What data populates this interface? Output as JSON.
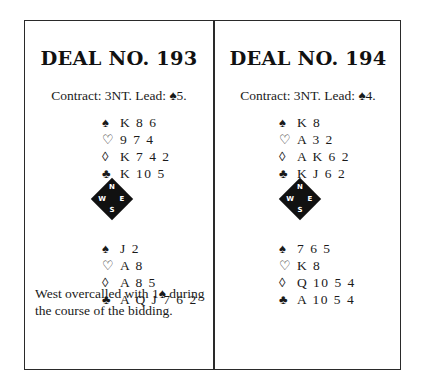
{
  "deals": [
    {
      "title": "DEAL NO. 193",
      "contract": "Contract: 3NT. Lead: ♠5.",
      "north": {
        "spades": {
          "symbol": "♠",
          "cards": "K 8 6"
        },
        "hearts": {
          "symbol": "♡",
          "cards": "9 7 4"
        },
        "diamonds": {
          "symbol": "◊",
          "cards": "K 7 4 2"
        },
        "clubs": {
          "symbol": "♣",
          "cards": "K 10 5"
        }
      },
      "south": {
        "spades": {
          "symbol": "♠",
          "cards": "J 2"
        },
        "hearts": {
          "symbol": "♡",
          "cards": "A 8"
        },
        "diamonds": {
          "symbol": "◊",
          "cards": "A 8 5"
        },
        "clubs": {
          "symbol": "♣",
          "cards": "A Q J 7 6 2"
        }
      },
      "compass": {
        "n": "N",
        "e": "E",
        "s": "S",
        "w": "W"
      },
      "note": "West overcalled with 1♠ during the course of the bidding."
    },
    {
      "title": "DEAL NO. 194",
      "contract": "Contract: 3NT. Lead: ♠4.",
      "north": {
        "spades": {
          "symbol": "♠",
          "cards": "K 8"
        },
        "hearts": {
          "symbol": "♡",
          "cards": "A 3 2"
        },
        "diamonds": {
          "symbol": "◊",
          "cards": "A K 6 2"
        },
        "clubs": {
          "symbol": "♣",
          "cards": "K J 6 2"
        }
      },
      "south": {
        "spades": {
          "symbol": "♠",
          "cards": "7 6 5"
        },
        "hearts": {
          "symbol": "♡",
          "cards": "K 8"
        },
        "diamonds": {
          "symbol": "◊",
          "cards": "Q 10 5 4"
        },
        "clubs": {
          "symbol": "♣",
          "cards": "A 10 5 4"
        }
      },
      "compass": {
        "n": "N",
        "e": "E",
        "s": "S",
        "w": "W"
      }
    }
  ]
}
